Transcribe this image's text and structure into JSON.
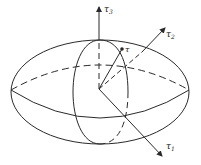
{
  "diagram": {
    "type": "stress-ellipsoid",
    "colors": {
      "stroke": "#2a2a2a",
      "background": "#ffffff"
    },
    "axes": [
      {
        "id": "tau1",
        "symbol": "τ",
        "subscript": "1"
      },
      {
        "id": "tau2",
        "symbol": "τ",
        "subscript": "2"
      },
      {
        "id": "tau3",
        "symbol": "τ",
        "subscript": "3"
      }
    ],
    "vector": {
      "id": "tau",
      "symbol": "τ"
    }
  }
}
